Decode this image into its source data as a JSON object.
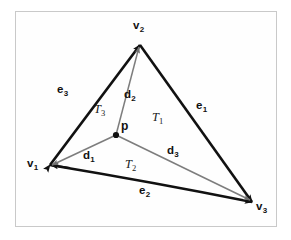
{
  "figure": {
    "type": "geometry-diagram",
    "background_color": "#ffffff",
    "frame_color": "#c9c9c9",
    "edge_color": "#111111",
    "sub_edge_color": "#7d7d7d",
    "label_color": "#111111"
  },
  "vertices": [
    {
      "id": "v1",
      "label": "v",
      "sub": "1",
      "x": 50,
      "y": 165,
      "label_x": 27,
      "label_y": 158
    },
    {
      "id": "v2",
      "label": "v",
      "sub": "2",
      "x": 140,
      "y": 45,
      "label_x": 133,
      "label_y": 20
    },
    {
      "id": "v3",
      "label": "v",
      "sub": "3",
      "x": 252,
      "y": 202,
      "label_x": 256,
      "label_y": 201
    },
    {
      "id": "p",
      "label": "p",
      "sub": "",
      "x": 116,
      "y": 135,
      "label_x": 121,
      "label_y": 120
    }
  ],
  "edges": [
    {
      "id": "e1",
      "label": "e",
      "sub": "1",
      "from": "v2",
      "to": "v3",
      "style": "thick",
      "arrow": "end",
      "label_x": 196,
      "label_y": 100
    },
    {
      "id": "e2",
      "label": "e",
      "sub": "2",
      "from": "v1",
      "to": "v3",
      "style": "thick",
      "arrow": "end",
      "label_x": 139,
      "label_y": 185
    },
    {
      "id": "e3",
      "label": "e",
      "sub": "3",
      "from": "v1",
      "to": "v2",
      "style": "thick",
      "arrow": "start_end",
      "label_x": 57,
      "label_y": 84
    }
  ],
  "spokes": [
    {
      "id": "d1",
      "label": "d",
      "sub": "1",
      "from": "p",
      "to": "v1",
      "style": "thin",
      "arrow": "end",
      "label_x": 83,
      "label_y": 150
    },
    {
      "id": "d2",
      "label": "d",
      "sub": "2",
      "from": "p",
      "to": "v2",
      "style": "thin",
      "arrow": "end",
      "label_x": 124,
      "label_y": 89
    },
    {
      "id": "d3",
      "label": "d",
      "sub": "3",
      "from": "p",
      "to": "v3",
      "style": "thin",
      "arrow": "end",
      "label_x": 167,
      "label_y": 145
    }
  ],
  "regions": [
    {
      "id": "T1",
      "label": "T",
      "sub": "1",
      "label_x": 152,
      "label_y": 111
    },
    {
      "id": "T2",
      "label": "T",
      "sub": "2",
      "label_x": 125,
      "label_y": 158
    },
    {
      "id": "T3",
      "label": "T",
      "sub": "3",
      "label_x": 94,
      "label_y": 103
    }
  ]
}
